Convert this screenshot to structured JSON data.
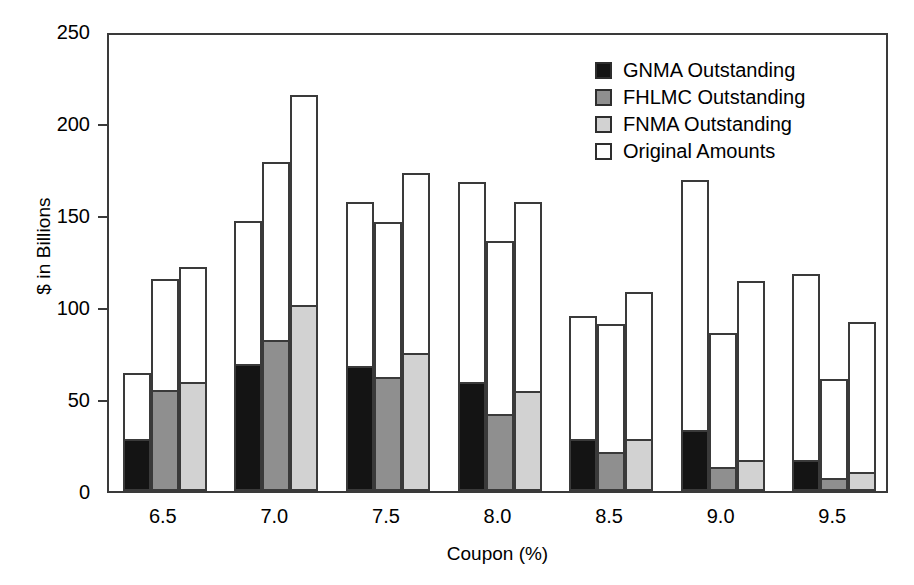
{
  "chart_data": {
    "type": "bar",
    "title": "",
    "xlabel": "Coupon (%)",
    "ylabel": "$ in Billions",
    "categories": [
      "6.5",
      "7.0",
      "7.5",
      "8.0",
      "8.5",
      "9.0",
      "9.5"
    ],
    "ylim": [
      0,
      250
    ],
    "yticks": [
      "0",
      "50",
      "100",
      "150",
      "200",
      "250"
    ],
    "ytick_values": [
      0,
      50,
      100,
      150,
      200,
      250
    ],
    "grid": false,
    "legend_position": "top-right",
    "legend": [
      {
        "label": "GNMA Outstanding",
        "color": "#141414"
      },
      {
        "label": "FHLMC Outstanding",
        "color": "#8f8f8f"
      },
      {
        "label": "FNMA Outstanding",
        "color": "#d2d2d2"
      },
      {
        "label": "Original Amounts",
        "color": "#ffffff"
      }
    ],
    "series": [
      {
        "name": "GNMA Original Amounts",
        "agency": "GNMA",
        "kind": "original",
        "values": [
          64,
          147,
          157,
          168,
          95,
          169,
          118
        ]
      },
      {
        "name": "GNMA Outstanding",
        "agency": "GNMA",
        "kind": "outstanding",
        "values": [
          27,
          68,
          67,
          58,
          27,
          32,
          16
        ]
      },
      {
        "name": "FHLMC Original Amounts",
        "agency": "FHLMC",
        "kind": "original",
        "values": [
          115,
          179,
          146,
          136,
          91,
          86,
          61
        ]
      },
      {
        "name": "FHLMC Outstanding",
        "agency": "FHLMC",
        "kind": "outstanding",
        "values": [
          54,
          81,
          61,
          41,
          20,
          12,
          6
        ]
      },
      {
        "name": "FNMA Original Amounts",
        "agency": "FNMA",
        "kind": "original",
        "values": [
          122,
          215,
          173,
          157,
          108,
          114,
          92
        ]
      },
      {
        "name": "FNMA Outstanding",
        "agency": "FNMA",
        "kind": "outstanding",
        "values": [
          58,
          100,
          74,
          53,
          27,
          16,
          9
        ]
      }
    ]
  }
}
